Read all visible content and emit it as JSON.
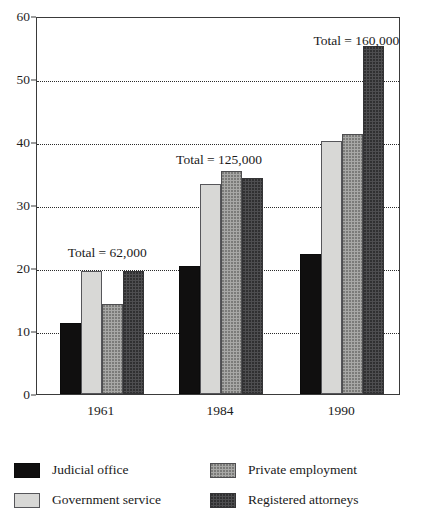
{
  "chart_data": {
    "type": "bar",
    "title": "",
    "subtitle": "",
    "xlabel": "",
    "ylabel": "",
    "categories": [
      "1961",
      "1984",
      "1990"
    ],
    "series": [
      {
        "name": "Judicial office",
        "color": "#100f0f",
        "values": [
          11.3,
          20.3,
          22.3
        ]
      },
      {
        "name": "Government service",
        "color": "#d8d8d6",
        "values": [
          19.5,
          33.3,
          40.2
        ]
      },
      {
        "name": "Private employment",
        "color": "#a8a8a6",
        "values": [
          14.3,
          35.4,
          41.2
        ]
      },
      {
        "name": "Registered attorneys",
        "color": "#4e4e50",
        "values": [
          19.5,
          34.3,
          55.2
        ]
      }
    ],
    "ylim": [
      0,
      60
    ],
    "yticks": [
      0,
      10,
      20,
      30,
      40,
      50,
      60
    ],
    "ytick_labels": [
      "0",
      "10",
      "20",
      "30",
      "40",
      "50",
      "60"
    ],
    "gridlines": [
      10,
      20,
      30,
      40,
      50
    ],
    "grid": true,
    "grid_style": "dotted",
    "legend_position": "bottom",
    "annotations": [
      {
        "text": "Total = 62,000",
        "category": "1961"
      },
      {
        "text": "Total = 125,000",
        "category": "1984"
      },
      {
        "text": "Total = 160,000",
        "category": "1990"
      }
    ]
  },
  "legend": {
    "items": [
      {
        "label": "Judicial office",
        "color": "#100f0f"
      },
      {
        "label": "Private employment",
        "color": "#a8a8a6"
      },
      {
        "label": "Government service",
        "color": "#d8d8d6"
      },
      {
        "label": "Registered attorneys",
        "color": "#4e4e50"
      }
    ]
  }
}
